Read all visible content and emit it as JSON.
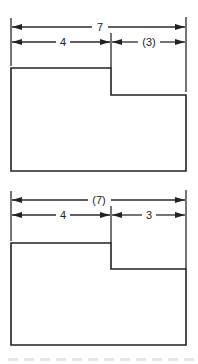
{
  "figures": [
    {
      "id": "top",
      "description": "Stepped block with overall dimension 7, left segment 4, right segment (3) as reference",
      "overall_dimension": {
        "label": "7",
        "is_reference": false
      },
      "segments": [
        {
          "label": "4",
          "is_reference": false
        },
        {
          "label": "(3)",
          "is_reference": true
        }
      ]
    },
    {
      "id": "bottom",
      "description": "Stepped block with overall dimension (7) as reference, left segment 4, right segment 3",
      "overall_dimension": {
        "label": "(7)",
        "is_reference": true
      },
      "segments": [
        {
          "label": "4",
          "is_reference": false
        },
        {
          "label": "3",
          "is_reference": false
        }
      ]
    }
  ],
  "colors": {
    "line": "#222222",
    "background": "#ffffff"
  }
}
